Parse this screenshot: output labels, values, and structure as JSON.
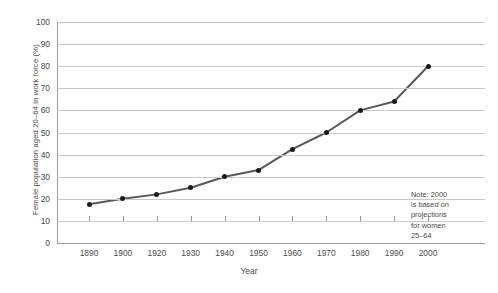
{
  "chart_data": {
    "type": "line",
    "title": "",
    "xlabel": "Year",
    "ylabel": "Female population aged 20–64 in work force (%)",
    "categories": [
      "1890",
      "1900",
      "1920",
      "1930",
      "1940",
      "1950",
      "1960",
      "1970",
      "1980",
      "1990",
      "2000"
    ],
    "values": [
      17.5,
      20,
      22,
      25,
      30,
      33,
      42.5,
      50,
      60,
      64,
      80
    ],
    "series": [
      {
        "name": "Female population aged 20–64 in work force (%)",
        "values": [
          17.5,
          20,
          22,
          25,
          30,
          33,
          42.5,
          50,
          60,
          64,
          80
        ]
      }
    ],
    "ylim": [
      0,
      100
    ],
    "ytick_labels": [
      "0",
      "10",
      "20",
      "30",
      "40",
      "50",
      "60",
      "70",
      "80",
      "90",
      "100"
    ],
    "ytick_values": [
      0,
      10,
      20,
      30,
      40,
      50,
      60,
      70,
      80,
      90,
      100
    ],
    "xtick_labels": [
      "1890",
      "1900",
      "1920",
      "1930",
      "1940",
      "1950",
      "1960",
      "1970",
      "1980",
      "1990",
      "2000"
    ],
    "grid": "horizontal",
    "legend": "none",
    "annotations": [
      {
        "name": "projection-note",
        "text": "Note: 2000\nis based on\nprojections\nfor women\n25–64"
      }
    ],
    "colors": {
      "line": "#595959",
      "marker": "#1a1a1a",
      "grid": "#c9c9c9",
      "axis": "#9a9a9a",
      "text": "#4a4a4a",
      "background": "#ffffff"
    }
  }
}
